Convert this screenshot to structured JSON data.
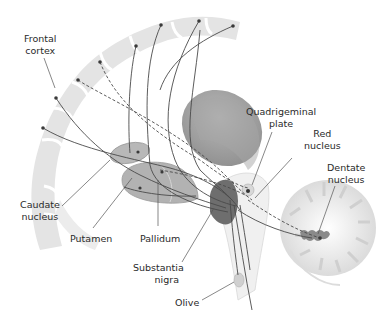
{
  "diagram": {
    "type": "anatomical illustration",
    "colors": {
      "background": "#ffffff",
      "cortex_gray_matter": "#e3e3e3",
      "white_matter": "#f7f7f7",
      "thalamus": "#9e9e9e",
      "basal_ganglia": "#b5b5b5",
      "substantia_nigra": "#6e6e6e",
      "fiber_lines": "#4a4a4a",
      "leader_lines": "#555555"
    },
    "labels": {
      "frontal_cortex": [
        "Frontal",
        "cortex"
      ],
      "caudate_nucleus": [
        "Caudate",
        "nucleus"
      ],
      "putamen": [
        "Putamen"
      ],
      "pallidum": [
        "Pallidum"
      ],
      "substantia_nigra": [
        "Substantia",
        "nigra"
      ],
      "olive": [
        "Olive"
      ],
      "quadrigeminal_plate": [
        "Quadrigeminal",
        "plate"
      ],
      "red_nucleus": [
        "Red",
        "nucleus"
      ],
      "dentate_nucleus": [
        "Dentate",
        "nucleus"
      ]
    }
  }
}
